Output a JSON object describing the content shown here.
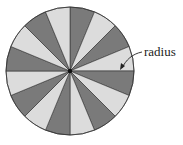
{
  "diagram": {
    "type": "sectored-circle",
    "sector_count": 16,
    "colors": {
      "dark": "#7a7a7a",
      "light": "#dcdcdc",
      "stroke": "#333333"
    },
    "label": "radius"
  }
}
